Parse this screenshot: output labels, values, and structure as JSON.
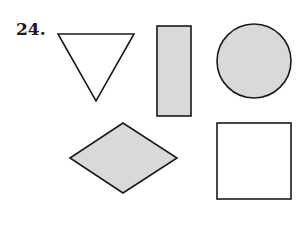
{
  "problem": {
    "number": "24."
  },
  "colors": {
    "stroke": "#1a1a1a",
    "shaded_fill": "#d9d9d9",
    "unshaded_fill": "#ffffff"
  },
  "shapes": [
    {
      "name": "triangle",
      "shaded": false
    },
    {
      "name": "rectangle",
      "shaded": true
    },
    {
      "name": "circle",
      "shaded": true
    },
    {
      "name": "rhombus",
      "shaded": true
    },
    {
      "name": "square",
      "shaded": false
    }
  ]
}
